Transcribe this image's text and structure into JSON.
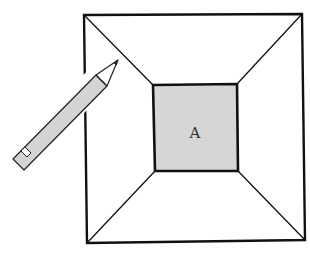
{
  "figure": {
    "inner_label": "A",
    "colors": {
      "line": "#111111",
      "background": "#ffffff",
      "inner_fill": "#d6d6d6",
      "pencil_fill": "#d4d4d4",
      "pencil_outline": "#222222"
    }
  },
  "shapes": {
    "outer_square": {
      "tl": [
        84,
        15
      ],
      "tr": [
        302,
        14
      ],
      "br": [
        305,
        240
      ],
      "bl": [
        87,
        243
      ]
    },
    "inner_square": {
      "tl": [
        153,
        85
      ],
      "tr": [
        237,
        84
      ],
      "br": [
        238,
        171
      ],
      "bl": [
        155,
        171
      ]
    },
    "pencil": {
      "tip": [
        118,
        60
      ],
      "eraser_end": [
        18,
        162
      ]
    }
  }
}
